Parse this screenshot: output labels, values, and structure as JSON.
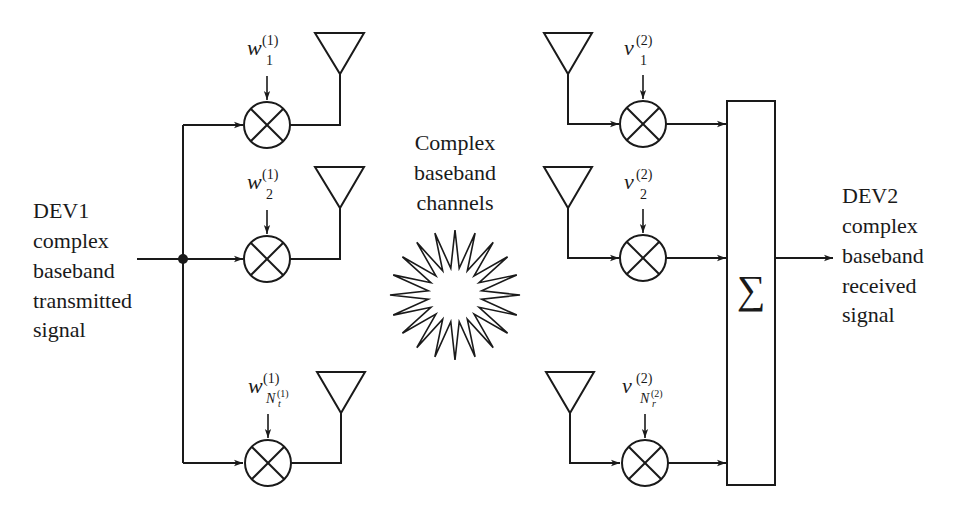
{
  "diagram": {
    "type": "block-diagram"
  },
  "transmitter": {
    "label_lines": [
      "DEV1",
      "complex",
      "baseband",
      "transmitted",
      "signal"
    ],
    "weights": [
      {
        "symbol": "w",
        "superscript": "(1)",
        "subscript": "1"
      },
      {
        "symbol": "w",
        "superscript": "(1)",
        "subscript": "2"
      },
      {
        "symbol": "w",
        "superscript": "(1)",
        "subscript_main": "N",
        "subscript_sub": "t",
        "subscript_sup": "(1)"
      }
    ]
  },
  "channel": {
    "label_lines": [
      "Complex",
      "baseband",
      "channels"
    ],
    "icon": "starburst-icon"
  },
  "receiver": {
    "weights": [
      {
        "symbol": "v",
        "superscript": "(2)",
        "subscript": "1"
      },
      {
        "symbol": "v",
        "superscript": "(2)",
        "subscript": "2"
      },
      {
        "symbol": "v",
        "superscript": "(2)",
        "subscript_main": "N",
        "subscript_sub": "r",
        "subscript_sup": "(2)"
      }
    ],
    "combiner_symbol": "∑",
    "label_lines": [
      "DEV2",
      "complex",
      "baseband",
      "received",
      "signal"
    ]
  },
  "colors": {
    "stroke": "#1a1a1a",
    "background": "#ffffff"
  }
}
